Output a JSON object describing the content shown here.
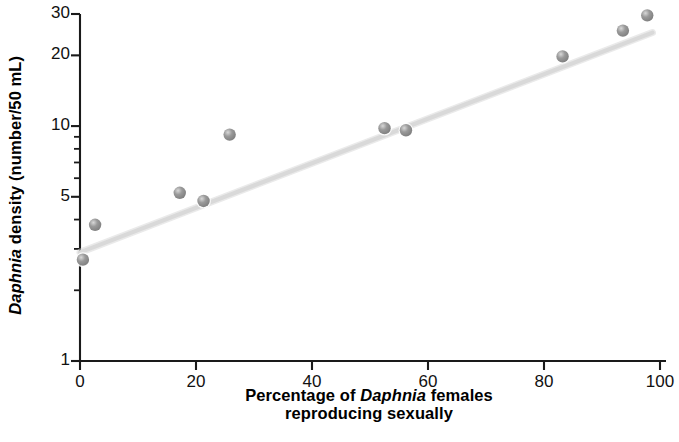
{
  "chart_data": {
    "type": "scatter",
    "title": "",
    "xlabel": "Percentage of Daphnia females reproducing sexually",
    "xlabel_line1_pre": "Percentage of ",
    "xlabel_line1_italic": "Daphnia",
    "xlabel_line1_post": " females",
    "xlabel_line2": "reproducing sexually",
    "ylabel": "Daphnia density (number/50 mL)",
    "ylabel_italic": "Daphnia",
    "ylabel_rest": " density (number/50 mL)",
    "xlim": [
      0,
      100
    ],
    "ylim": [
      1,
      30
    ],
    "yscale": "log",
    "xscale": "linear",
    "grid": false,
    "legend": null,
    "xticks": [
      0,
      20,
      40,
      60,
      80,
      100
    ],
    "xtick_labels": [
      "0",
      "20",
      "40",
      "60",
      "80",
      "100"
    ],
    "yticks": [
      1,
      5,
      10,
      20,
      30
    ],
    "ytick_labels": [
      "1",
      "5",
      "10",
      "20",
      "30"
    ],
    "yminor_ticks": [
      2,
      3,
      4,
      6,
      7,
      8,
      9
    ],
    "marker_color": "#9a9a9a",
    "marker_highlight_color": "#d8d8d8",
    "trendline_color": "#d9d9d9",
    "axis_color": "#1a1a1a",
    "points": [
      {
        "x": 0.5,
        "y": 2.7
      },
      {
        "x": 2.6,
        "y": 3.8
      },
      {
        "x": 17.2,
        "y": 5.2
      },
      {
        "x": 21.3,
        "y": 4.8
      },
      {
        "x": 25.8,
        "y": 9.2
      },
      {
        "x": 52.5,
        "y": 9.8
      },
      {
        "x": 56.2,
        "y": 9.6
      },
      {
        "x": 83.2,
        "y": 19.8
      },
      {
        "x": 93.6,
        "y": 25.5
      },
      {
        "x": 97.8,
        "y": 29.6
      }
    ],
    "trendline": {
      "x1": 0.0,
      "y1": 2.9,
      "x2": 98.7,
      "y2": 25.0
    }
  }
}
